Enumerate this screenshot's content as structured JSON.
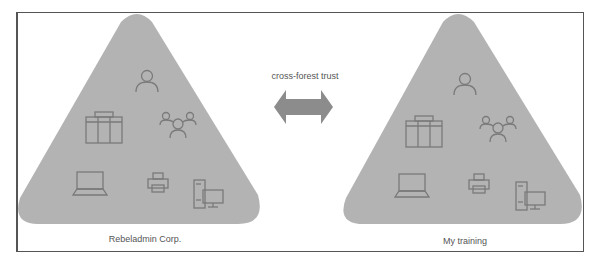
{
  "forests": [
    {
      "name": "Rebeladmin Corp.",
      "icons": [
        "user-icon",
        "server-rack-icon",
        "group-icon",
        "laptop-icon",
        "printer-icon",
        "desktop-icon"
      ]
    },
    {
      "name": "My training",
      "icons": [
        "user-icon",
        "server-rack-icon",
        "group-icon",
        "laptop-icon",
        "printer-icon",
        "desktop-icon"
      ]
    }
  ],
  "trust": {
    "label": "cross-forest trust",
    "direction": "bidirectional"
  },
  "colors": {
    "triangle": "#b3b3b3",
    "icon_stroke": "#7a7a7a",
    "arrow": "#8c8c8c",
    "frame": "#555555",
    "text": "#555555"
  }
}
